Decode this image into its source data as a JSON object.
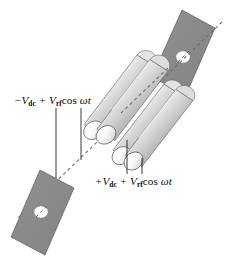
{
  "figure": {
    "name": "quadrupole-mass-filter",
    "background_color": "#ffffff",
    "width": 226,
    "height": 267
  },
  "labels": {
    "negative_rod_pair": {
      "sign": "−",
      "v_symbol": "V",
      "dc_subscript": "dc",
      "plus_operator": "+",
      "rf_symbol": "V",
      "rf_subscript": "rf",
      "cos_function": "cos",
      "omega": "ω",
      "time": "t",
      "full_text": "−Vdc + Vrf cos ωt"
    },
    "positive_rod_pair": {
      "sign": "+",
      "v_symbol": "V",
      "dc_subscript": "dc",
      "plus_operator": "+",
      "rf_symbol": "V",
      "rf_subscript": "rf",
      "cos_function": "cos",
      "omega": "ω",
      "time": "t",
      "full_text": "+Vdc + Vrf cos ωt"
    }
  },
  "colors": {
    "plate_fill": "#8a8a8a",
    "plate_edge": "#4a4a4a",
    "aperture_fill": "#ffffff",
    "rod_light": "#ffffff",
    "rod_mid": "#c9c9c9",
    "rod_dark": "#6f6f6f",
    "rod_outline": "#5a5a5a",
    "axis_dash": "#6a6a6a",
    "leader_line": "#1a1a1a",
    "text": "#0b0b0b"
  },
  "elements": {
    "entrance_plate_label": "exit-aperture-plate",
    "exit_plate_label": "entrance-aperture-plate",
    "axis_label": "ion-beam-axis",
    "rods": [
      "rod-upper-back",
      "rod-upper-front",
      "rod-lower-back",
      "rod-lower-front"
    ]
  }
}
